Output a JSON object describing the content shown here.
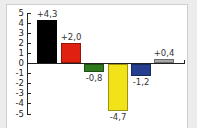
{
  "chart_data": {
    "type": "bar",
    "title": "",
    "xlabel": "",
    "ylabel": "",
    "ylim": [
      -5,
      5
    ],
    "yticks": [
      5,
      4,
      3,
      2,
      1,
      0,
      -1,
      -2,
      -3,
      -4,
      -5
    ],
    "grid": false,
    "legend": null,
    "categories": [
      "1",
      "2",
      "3",
      "4",
      "5",
      "6"
    ],
    "values": [
      4.3,
      2.0,
      -0.8,
      -4.7,
      -1.2,
      0.4
    ],
    "value_labels": [
      "+4,3",
      "+2,0",
      "-0,8",
      "-4,7",
      "-1,2",
      "+0,4"
    ],
    "colors": [
      "#000000",
      "#e02010",
      "#2f7a1f",
      "#f2e21a",
      "#253f8e",
      "#a8a8a8"
    ]
  },
  "yaxis": {
    "labels": [
      "5",
      "4",
      "3",
      "2",
      "1",
      "0",
      "-1",
      "-2",
      "-3",
      "-4",
      "-5"
    ]
  }
}
